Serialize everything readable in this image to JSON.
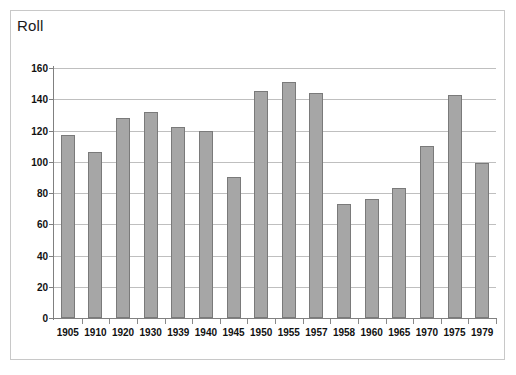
{
  "chart_data": {
    "type": "bar",
    "title": "Roll",
    "xlabel": "",
    "ylabel": "",
    "ylim": [
      0,
      160
    ],
    "yticks": [
      0,
      20,
      40,
      60,
      80,
      100,
      120,
      140,
      160
    ],
    "grid": true,
    "legend": false,
    "bar_color": "#a6a6a6",
    "bar_border_color": "#7a7a7a",
    "gridline_color": "#bfbfbf",
    "axis_color": "#808080",
    "frame_border_color": "#c8c8c8",
    "categories": [
      "1905",
      "1910",
      "1920",
      "1930",
      "1939",
      "1940",
      "1945",
      "1950",
      "1955",
      "1957",
      "1958",
      "1960",
      "1965",
      "1970",
      "1975",
      "1979"
    ],
    "values": [
      117,
      106,
      128,
      132,
      122,
      120,
      90,
      145,
      151,
      144,
      73,
      76,
      83,
      110,
      143,
      99
    ]
  }
}
